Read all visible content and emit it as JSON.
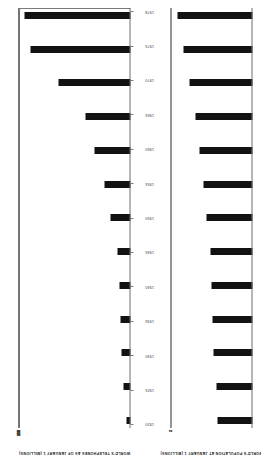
{
  "figure": {
    "name": "world-telephones-and-population-bar-charts",
    "orientation_note": "landscape figure rotated 90 degrees on a portrait page scan"
  },
  "years": [
    "1920",
    "1925",
    "1930",
    "1935",
    "1940",
    "1945",
    "1950",
    "1955",
    "1960",
    "1965",
    "1970",
    "1975",
    "1978"
  ],
  "chart_data": [
    {
      "type": "bar",
      "id": "telephones",
      "title": "WORLD'S TELEPHONES AS OF JANUARY 1",
      "subtitle": "(MILLIONS)",
      "ylabel": "WORLD'S TELEPHONES AS OF JANUARY 1 (MILLIONS)",
      "xlabel": "",
      "categories": [
        "1920",
        "1925",
        "1930",
        "1935",
        "1940",
        "1945",
        "1950",
        "1955",
        "1960",
        "1965",
        "1970",
        "1975",
        "1978"
      ],
      "values": [
        13,
        26,
        33,
        34,
        40,
        45,
        72,
        94,
        128,
        160,
        256,
        356,
        380
      ],
      "ylim": [
        0,
        400
      ],
      "yticks": [
        0,
        50,
        100,
        150,
        200,
        250,
        300,
        350,
        400
      ],
      "ytick_labels": [
        "0",
        "50",
        "100",
        "150",
        "200",
        "250",
        "300",
        "350",
        "400"
      ],
      "grid": true,
      "legend": "none"
    },
    {
      "type": "bar",
      "id": "population",
      "title": "WORLD'S POPULATION AT JANUARY 1",
      "subtitle": "(BILLIONS)",
      "ylabel": "WORLD'S POPULATION AT JANUARY 1 (BILLIONS)",
      "xlabel": "",
      "categories": [
        "1920",
        "1925",
        "1930",
        "1935",
        "1940",
        "1945",
        "1950",
        "1955",
        "1960",
        "1965",
        "1970",
        "1975",
        "1978"
      ],
      "values": [
        1.86,
        1.91,
        2.02,
        2.08,
        2.16,
        2.2,
        2.4,
        2.56,
        2.76,
        3.0,
        3.3,
        3.6,
        3.95
      ],
      "ylim": [
        0,
        4.3
      ],
      "yticks": [
        1,
        2,
        3,
        4
      ],
      "ytick_labels": [
        "1",
        "2",
        "3",
        "4"
      ],
      "grid": true,
      "legend": "none"
    }
  ]
}
